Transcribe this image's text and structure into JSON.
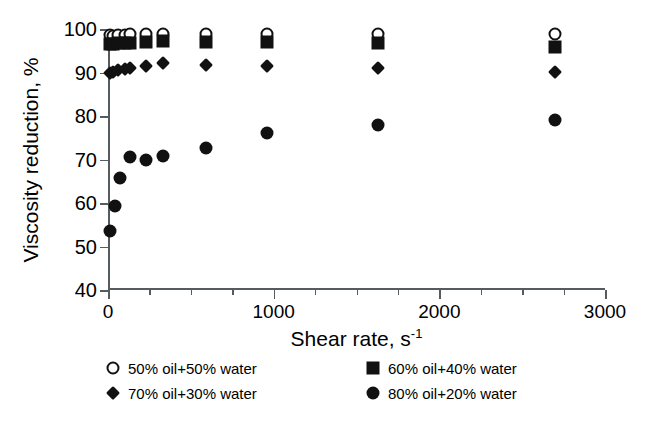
{
  "chart_data": {
    "type": "scatter",
    "title": "",
    "xlabel": "Shear rate, s-1",
    "xlabel_base": "Shear rate, s",
    "xlabel_sup": "-1",
    "ylabel": "Viscosity reduction, %",
    "xlim": [
      0,
      3000
    ],
    "ylim": [
      40,
      100
    ],
    "xticks": [
      0,
      1000,
      2000,
      3000
    ],
    "xtick_labels": [
      "0",
      "1000",
      "2000",
      "3000"
    ],
    "xminor_interval": 250,
    "yticks": [
      40,
      50,
      60,
      70,
      80,
      90,
      100
    ],
    "ytick_labels": [
      "40",
      "50",
      "60",
      "70",
      "80",
      "90",
      "100"
    ],
    "grid": false,
    "legend_position": "below-plot",
    "marker_color": "#111111",
    "axis_color": "#555b5e",
    "background": "#ffffff",
    "series": [
      {
        "name": "50% oil+50% water",
        "marker": "open-circle",
        "marker_name": "open-circle-marker",
        "points": [
          {
            "x": 10,
            "y": 98.6
          },
          {
            "x": 30,
            "y": 98.5
          },
          {
            "x": 60,
            "y": 98.7
          },
          {
            "x": 100,
            "y": 98.6
          },
          {
            "x": 130,
            "y": 98.8
          },
          {
            "x": 230,
            "y": 98.8
          },
          {
            "x": 330,
            "y": 98.8
          },
          {
            "x": 590,
            "y": 98.9
          },
          {
            "x": 960,
            "y": 98.9
          },
          {
            "x": 1630,
            "y": 98.9
          },
          {
            "x": 2700,
            "y": 98.8
          }
        ]
      },
      {
        "name": "60% oil+40% water",
        "marker": "filled-square",
        "marker_name": "filled-square-marker",
        "points": [
          {
            "x": 10,
            "y": 96.5
          },
          {
            "x": 30,
            "y": 96.6
          },
          {
            "x": 60,
            "y": 96.7
          },
          {
            "x": 100,
            "y": 96.8
          },
          {
            "x": 130,
            "y": 96.8
          },
          {
            "x": 230,
            "y": 97.0
          },
          {
            "x": 330,
            "y": 97.2
          },
          {
            "x": 590,
            "y": 97.0
          },
          {
            "x": 960,
            "y": 96.9
          },
          {
            "x": 1630,
            "y": 96.7
          },
          {
            "x": 2700,
            "y": 95.8
          }
        ]
      },
      {
        "name": "70% oil+30% water",
        "marker": "filled-diamond",
        "marker_name": "filled-diamond-marker",
        "points": [
          {
            "x": 10,
            "y": 90.0
          },
          {
            "x": 30,
            "y": 90.2
          },
          {
            "x": 60,
            "y": 90.6
          },
          {
            "x": 100,
            "y": 90.7
          },
          {
            "x": 130,
            "y": 91.0
          },
          {
            "x": 230,
            "y": 91.6
          },
          {
            "x": 330,
            "y": 92.1
          },
          {
            "x": 590,
            "y": 91.7
          },
          {
            "x": 960,
            "y": 91.4
          },
          {
            "x": 1630,
            "y": 91.1
          },
          {
            "x": 2700,
            "y": 90.2
          }
        ]
      },
      {
        "name": "80% oil+20% water",
        "marker": "filled-circle",
        "marker_name": "filled-circle-marker",
        "points": [
          {
            "x": 10,
            "y": 53.6
          },
          {
            "x": 40,
            "y": 59.3
          },
          {
            "x": 75,
            "y": 65.7
          },
          {
            "x": 130,
            "y": 70.5
          },
          {
            "x": 230,
            "y": 69.8
          },
          {
            "x": 330,
            "y": 70.9
          },
          {
            "x": 590,
            "y": 72.6
          },
          {
            "x": 960,
            "y": 76.1
          },
          {
            "x": 1630,
            "y": 77.9
          },
          {
            "x": 2700,
            "y": 79.0
          }
        ]
      }
    ],
    "legend": [
      {
        "label": "50% oil+50% water",
        "marker": "open-circle"
      },
      {
        "label": "60% oil+40% water",
        "marker": "filled-square"
      },
      {
        "label": "70% oil+30% water",
        "marker": "filled-diamond"
      },
      {
        "label": "80% oil+20% water",
        "marker": "filled-circle"
      }
    ]
  }
}
